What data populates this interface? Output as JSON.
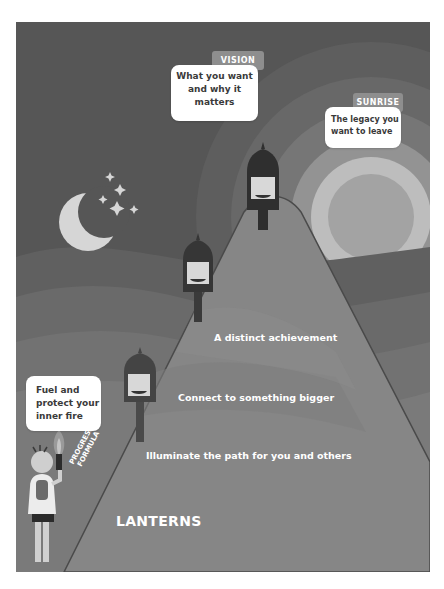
{
  "poster": {
    "title": "LANTERNS",
    "diagonal_label": [
      "PROGRESS",
      "FORMULA"
    ],
    "vision": {
      "tag": "VISION",
      "lines": [
        "What you want",
        "and why it",
        "matters"
      ]
    },
    "sunrise": {
      "tag": "SUNRISE",
      "lines": [
        "The legacy you",
        "want to leave"
      ]
    },
    "inner_fire": {
      "lines": [
        "Fuel and",
        "protect your",
        "inner fire"
      ]
    },
    "mountain_levels": [
      "A distinct achievement",
      "Connect to something bigger",
      "Illuminate the path for you and others"
    ],
    "icons": [
      "moon-icon",
      "stars-icon",
      "sun-icon",
      "lantern-icon",
      "torch-icon",
      "person-icon"
    ]
  }
}
